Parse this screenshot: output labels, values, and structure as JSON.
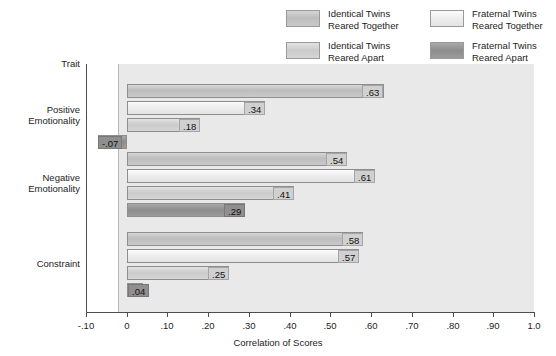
{
  "legend": {
    "items": [
      {
        "key": "itt",
        "line1": "Identical Twins",
        "line2": "Reared Together",
        "color": "#c4c4c4"
      },
      {
        "key": "ftt",
        "line1": "Fraternal Twins",
        "line2": "Reared Together",
        "color": "#eeeeee"
      },
      {
        "key": "ita",
        "line1": "Identical Twins",
        "line2": "Reared Apart",
        "color": "#d2d2d2"
      },
      {
        "key": "fta",
        "line1": "Fraternal Twins",
        "line2": "Reared Apart",
        "color": "#949494"
      }
    ]
  },
  "axes": {
    "y_header": "Trait",
    "x_title": "Correlation of Scores",
    "x_ticks": [
      "-.10",
      "0",
      ".10",
      ".20",
      ".30",
      ".40",
      ".50",
      ".60",
      ".70",
      ".80",
      ".90",
      "1.0"
    ]
  },
  "groups": [
    {
      "name_line1": "Positive",
      "name_line2": "Emotionality"
    },
    {
      "name_line1": "Negative",
      "name_line2": "Emotionality"
    },
    {
      "name_line1": "Constraint",
      "name_line2": ""
    }
  ],
  "chart_data": {
    "type": "bar",
    "orientation": "horizontal",
    "title": "",
    "xlabel": "Correlation of Scores",
    "ylabel": "Trait",
    "xlim": [
      -0.1,
      1.0
    ],
    "xtick_values": [
      -0.1,
      0,
      0.1,
      0.2,
      0.3,
      0.4,
      0.5,
      0.6,
      0.7,
      0.8,
      0.9,
      1.0
    ],
    "xtick_labels": [
      "-.10",
      "0",
      ".10",
      ".20",
      ".30",
      ".40",
      ".50",
      ".60",
      ".70",
      ".80",
      ".90",
      "1.0"
    ],
    "grid": false,
    "legend_position": "top-right",
    "categories": [
      "Positive Emotionality",
      "Negative Emotionality",
      "Constraint"
    ],
    "series": [
      {
        "name": "Identical Twins Reared Together",
        "key": "itt",
        "color": "#c4c4c4",
        "values": [
          0.63,
          0.54,
          0.58
        ],
        "labels": [
          ".63",
          ".54",
          ".58"
        ]
      },
      {
        "name": "Fraternal Twins Reared Together",
        "key": "ftt",
        "color": "#eeeeee",
        "values": [
          0.34,
          0.61,
          0.57
        ],
        "labels": [
          ".34",
          ".61",
          ".57"
        ]
      },
      {
        "name": "Identical Twins Reared Apart",
        "key": "ita",
        "color": "#d2d2d2",
        "values": [
          0.18,
          0.41,
          0.25
        ],
        "labels": [
          ".18",
          ".41",
          ".25"
        ]
      },
      {
        "name": "Fraternal Twins Reared Apart",
        "key": "fta",
        "color": "#949494",
        "values": [
          -0.07,
          0.29,
          0.04
        ],
        "labels": [
          "-.07",
          ".29",
          ".04"
        ]
      }
    ]
  }
}
